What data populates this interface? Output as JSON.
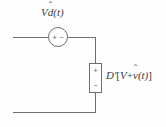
{
  "figure": {
    "type": "circuit-diagram",
    "background_color": "#fefefe",
    "line_color": "#6e6e6e",
    "text_color": "#3a3a3a"
  },
  "source": {
    "name": "independent-voltage-source",
    "symbol": "circle",
    "label_full": "Vd̂(t)",
    "label_parts": {
      "gain": "V",
      "variable": "d",
      "hat": "̂",
      "argument": "(t)"
    },
    "polarity_plus": "+",
    "polarity_minus": "−"
  },
  "element": {
    "name": "dependent-source-box",
    "symbol": "rectangle",
    "label_full": "D′[V + v̂(t)]",
    "label_parts": {
      "coefficient": "D′",
      "bracket_open": "[",
      "dc_term": "V",
      "operator": "+",
      "ac_variable": "v",
      "hat": "̂",
      "argument": "(t)",
      "bracket_close": "]"
    },
    "terminal_plus": "+",
    "terminal_minus": "−"
  },
  "wires": {
    "top_label": "top-horizontal-wire",
    "bottom_label": "bottom-horizontal-wire",
    "right_upper_label": "right-vertical-wire-upper",
    "right_lower_label": "right-vertical-wire-lower"
  }
}
